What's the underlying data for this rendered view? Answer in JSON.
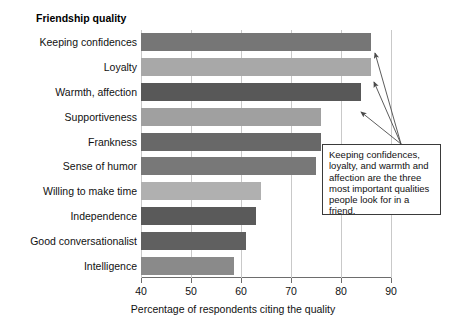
{
  "chart_data": {
    "type": "bar",
    "orientation": "horizontal",
    "title": "Friendship quality",
    "xlabel": "Percentage of respondents citing the quality",
    "ylabel": "",
    "xlim": [
      40,
      90
    ],
    "xticks": [
      40,
      50,
      60,
      70,
      80,
      90
    ],
    "grid": true,
    "legend": false,
    "categories": [
      "Keeping confidences",
      "Loyalty",
      "Warmth, affection",
      "Supportiveness",
      "Frankness",
      "Sense of humor",
      "Willing to make time",
      "Independence",
      "Good conversationalist",
      "Intelligence"
    ],
    "values": [
      86,
      86,
      84,
      76,
      76,
      75,
      64,
      63,
      61,
      58.5
    ],
    "bar_colors": [
      "#767676",
      "#a8a8a8",
      "#585858",
      "#a0a0a0",
      "#686868",
      "#787878",
      "#b0b0b0",
      "#5a5a5a",
      "#606060",
      "#8a8a8a"
    ],
    "annotations": [
      {
        "text": "Keeping confidences, loyalty, and warmth and affection are the three most important qualities people look for in a friend.",
        "points_to": [
          "Keeping confidences",
          "Loyalty",
          "Warmth, affection"
        ]
      }
    ],
    "axis_color": "#6d6d6d",
    "grid_color": "#c9c9c9"
  }
}
